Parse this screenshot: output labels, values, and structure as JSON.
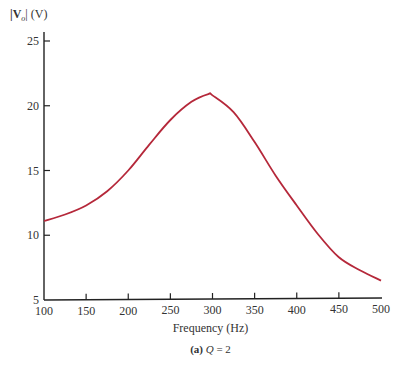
{
  "chart_data": {
    "type": "line",
    "title": "",
    "caption": "(a) Q = 2",
    "xlabel": "Frequency (Hz)",
    "ylabel": "|Vo| (V)",
    "xlim": [
      100,
      500
    ],
    "ylim": [
      5,
      25
    ],
    "xticks": [
      100,
      150,
      200,
      250,
      300,
      350,
      400,
      450,
      500
    ],
    "yticks": [
      5,
      10,
      15,
      20,
      25
    ],
    "grid": false,
    "series": [
      {
        "name": "|Vo|",
        "color": "#b5283a",
        "x": [
          100,
          125,
          150,
          175,
          200,
          225,
          250,
          275,
          295,
          300,
          325,
          350,
          375,
          400,
          425,
          450,
          475,
          500
        ],
        "values": [
          11.1,
          11.6,
          12.3,
          13.4,
          15.0,
          17.0,
          18.9,
          20.3,
          20.9,
          20.8,
          19.5,
          17.2,
          14.6,
          12.3,
          10.1,
          8.3,
          7.3,
          6.5
        ]
      }
    ]
  },
  "labels": {
    "ylabel_prefix": "|V",
    "ylabel_sub": "o",
    "ylabel_suffix": "| (V)",
    "xlabel": "Frequency (Hz)",
    "caption_prefix": "(a)",
    "caption_var": "Q",
    "caption_rest": " = 2"
  }
}
